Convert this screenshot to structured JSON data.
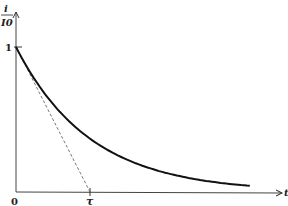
{
  "chart_data": {
    "type": "line",
    "title": "",
    "function": "exp(-t/tau)",
    "xlabel": "t",
    "ylabel_numerator": "i",
    "ylabel_denominator": "I0",
    "ylabel": "i/I0",
    "y_tick_labels": [
      "1"
    ],
    "y_ticks": [
      1
    ],
    "x_tick_labels": [
      "0",
      "τ"
    ],
    "x_ticks": [
      0,
      1
    ],
    "x_range_in_tau": [
      0,
      3.16
    ],
    "ylim": [
      0,
      1
    ],
    "series": [
      {
        "name": "decay-curve",
        "style": "solid",
        "equation": "i/I0 = e^(-t/τ)"
      },
      {
        "name": "initial-tangent",
        "style": "dashed",
        "from": [
          0,
          1
        ],
        "to": [
          1,
          0
        ]
      }
    ],
    "grid": false
  }
}
